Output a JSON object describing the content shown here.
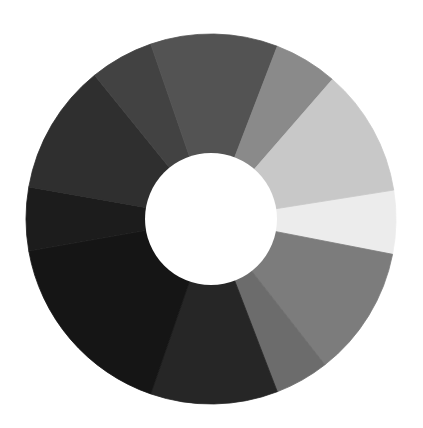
{
  "image": {
    "subject": "grayscale value wheel (painted donut of gray segments)",
    "background": "#ffffff"
  },
  "wheel": {
    "center": [
      211,
      219
    ],
    "outer_radius": 185,
    "inner_radius": 66,
    "hole_color": "#ffffff",
    "segments": [
      {
        "start": -9,
        "end": 11,
        "color": "#ececec",
        "name": "very-light"
      },
      {
        "start": 11,
        "end": 52,
        "color": "#7c7c7c",
        "name": "mid-gray-lower-right"
      },
      {
        "start": 52,
        "end": 69,
        "color": "#6c6c6c",
        "name": "gray-lower-right"
      },
      {
        "start": 69,
        "end": 109,
        "color": "#262626",
        "name": "dark-bottom"
      },
      {
        "start": 109,
        "end": 170,
        "color": "#151515",
        "name": "very-dark-lower-left"
      },
      {
        "start": 170,
        "end": 190,
        "color": "#1c1c1c",
        "name": "dark-left"
      },
      {
        "start": 190,
        "end": 231,
        "color": "#2f2f2f",
        "name": "dark-gray-upper-left"
      },
      {
        "start": 231,
        "end": 251,
        "color": "#424242",
        "name": "gray-upper-left"
      },
      {
        "start": 251,
        "end": 291,
        "color": "#535353",
        "name": "gray-top"
      },
      {
        "start": 291,
        "end": 311,
        "color": "#8a8a8a",
        "name": "mid-gray-top-right"
      },
      {
        "start": 311,
        "end": 351,
        "color": "#c8c8c8",
        "name": "light-right"
      }
    ]
  }
}
